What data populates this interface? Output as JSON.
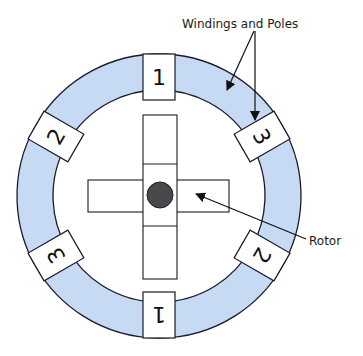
{
  "labels": {
    "windings_and_poles": "Windings and Poles",
    "rotor": "Rotor"
  },
  "colors": {
    "ring_fill": "#c6daf3",
    "stroke": "#1a1a2a",
    "hub_fill": "#48484c",
    "background": "#ffffff"
  },
  "stator": {
    "center": [
      159,
      196
    ],
    "outer_radius": 142,
    "inner_radius": 106
  },
  "poles": [
    {
      "id": "pole-top",
      "number": "1",
      "angle": 0
    },
    {
      "id": "pole-upper-right",
      "number": "3",
      "angle": 60
    },
    {
      "id": "pole-lower-right",
      "number": "2",
      "angle": 120
    },
    {
      "id": "pole-bottom",
      "number": "1",
      "angle": 180
    },
    {
      "id": "pole-lower-left",
      "number": "3",
      "angle": 240
    },
    {
      "id": "pole-upper-left",
      "number": "2",
      "angle": 300
    }
  ],
  "rotor": {
    "vertical_bar": {
      "x": 143,
      "y": 115,
      "w": 34,
      "h": 164
    },
    "horizontal_bar": {
      "x": 88,
      "y": 180,
      "w": 141,
      "h": 32
    },
    "hub": {
      "cx": 160,
      "cy": 195,
      "r": 13
    }
  }
}
